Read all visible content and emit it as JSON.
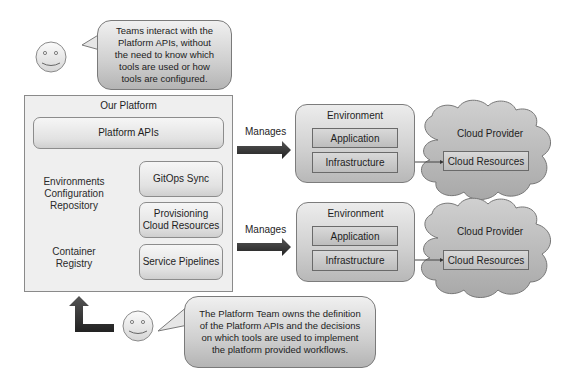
{
  "top_callout": {
    "actor": "teams-smiley",
    "text": "Teams interact with the\nPlatform APIs, without\nthe need to know which\ntools are used or how\ntools are configured."
  },
  "platform": {
    "title": "Our Platform",
    "apis_label": "Platform APIs",
    "repositories": [
      {
        "label": "Environments\nConfiguration\nRepository"
      },
      {
        "label": "Container\nRegistry"
      }
    ],
    "tools": [
      {
        "label": "GitOps Sync"
      },
      {
        "label": "Provisioning\nCloud Resources"
      },
      {
        "label": "Service Pipelines"
      }
    ]
  },
  "relations": [
    {
      "label": "Manages"
    },
    {
      "label": "Manages"
    }
  ],
  "environments": [
    {
      "title": "Environment",
      "application_label": "Application",
      "infrastructure_label": "Infrastructure",
      "cloud": {
        "title": "Cloud Provider",
        "resources_label": "Cloud Resources"
      }
    },
    {
      "title": "Environment",
      "application_label": "Application",
      "infrastructure_label": "Infrastructure",
      "cloud": {
        "title": "Cloud Provider",
        "resources_label": "Cloud Resources"
      }
    }
  ],
  "bottom_callout": {
    "actor": "platform-team-smiley",
    "text": "The Platform Team owns the definition\nof the Platform APIs and the decisions\non which tools are used to implement\nthe platform provided workflows."
  },
  "colors": {
    "arrow": "#3a3a3a",
    "box_border": "#8a8a8a",
    "cloud_fill": "#bdbdbd",
    "platform_bg": "#efefef"
  }
}
